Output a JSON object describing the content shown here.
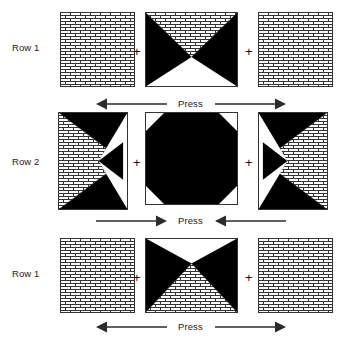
{
  "diagram": {
    "background_color": "#ffffff",
    "fabric_colors": {
      "dark": "#000000",
      "light": "#ffffff",
      "brick_line": "#333333"
    },
    "join_symbol": "+"
  },
  "rows": [
    {
      "id": "row-1-top",
      "label": "Row 1",
      "blocks": [
        {
          "name": "brick-square-block",
          "type": "plain-brick-square"
        },
        {
          "name": "hourglass-block-top",
          "type": "hourglass-brick-top-white-bottom"
        },
        {
          "name": "brick-square-block",
          "type": "plain-brick-square"
        }
      ],
      "joins": [
        "+",
        "+"
      ],
      "press": {
        "label": "Press",
        "direction": "outward",
        "left_arrow": "left",
        "right_arrow": "right"
      }
    },
    {
      "id": "row-2-middle",
      "label": "Row 2",
      "blocks": [
        {
          "name": "quarter-triangle-block-left",
          "type": "brick-left-white-right-black-top-bottom"
        },
        {
          "name": "snowball-octagon-block",
          "type": "octagon-dark-on-white"
        },
        {
          "name": "quarter-triangle-block-right",
          "type": "white-left-brick-right-black-top-bottom"
        }
      ],
      "joins": [
        "+",
        "+"
      ],
      "press": {
        "label": "Press",
        "direction": "inward",
        "left_arrow": "right",
        "right_arrow": "left"
      }
    },
    {
      "id": "row-1-bottom",
      "label": "Row 1",
      "blocks": [
        {
          "name": "brick-square-block",
          "type": "plain-brick-square"
        },
        {
          "name": "hourglass-block-bottom",
          "type": "hourglass-white-top-brick-bottom"
        },
        {
          "name": "brick-square-block",
          "type": "plain-brick-square"
        }
      ],
      "joins": [
        "+",
        "+"
      ],
      "press": {
        "label": "Press",
        "direction": "outward",
        "left_arrow": "left",
        "right_arrow": "right"
      }
    }
  ]
}
